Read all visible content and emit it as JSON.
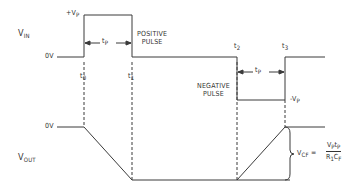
{
  "diagram": {
    "type": "timing-diagram",
    "signals": {
      "vin": {
        "label": "V",
        "sub": "IN"
      },
      "vout": {
        "label": "V",
        "sub": "OUT"
      }
    },
    "levels": {
      "vin_zero": "0V",
      "vout_zero": "0V",
      "positive_peak": {
        "sign": "+",
        "label": "V",
        "sub": "P"
      },
      "negative_peak": {
        "sign": "-",
        "label": "V",
        "sub": "P"
      }
    },
    "time_markers": [
      {
        "label": "t",
        "sub": "0"
      },
      {
        "label": "t",
        "sub": "1"
      },
      {
        "label": "t",
        "sub": "2"
      },
      {
        "label": "t",
        "sub": "3"
      }
    ],
    "pulse_width": {
      "label": "t",
      "sub": "P"
    },
    "annotations": {
      "positive_pulse": [
        "POSITIVE",
        "PULSE"
      ],
      "negative_pulse": [
        "NEGATIVE",
        "PULSE"
      ]
    },
    "equation": {
      "lhs": "V",
      "lhs_sub": "CF",
      "equals": "=",
      "numerator": "VₚTₚ",
      "num_parts": [
        {
          "t": "V",
          "s": "P"
        },
        {
          "t": "t",
          "s": "P"
        }
      ],
      "den_parts": [
        {
          "t": "R",
          "s": "1"
        },
        {
          "t": "C",
          "s": "F"
        }
      ]
    },
    "colors": {
      "line": "#333333",
      "background": "#ffffff"
    }
  }
}
